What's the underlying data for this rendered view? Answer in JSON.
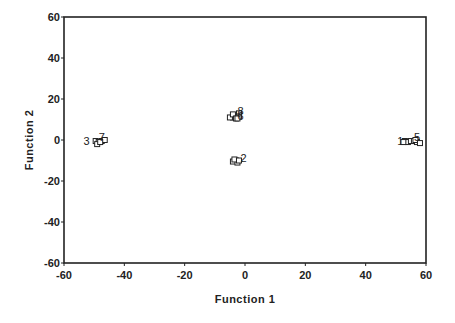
{
  "chart_data": {
    "type": "scatter",
    "title": "",
    "xlabel": "Function 1",
    "ylabel": "Function 2",
    "xlim": [
      -60,
      60
    ],
    "ylim": [
      -60,
      60
    ],
    "xticks": [
      -60,
      -40,
      -20,
      0,
      20,
      40,
      60
    ],
    "yticks": [
      -60,
      -40,
      -20,
      0,
      20,
      40,
      60
    ],
    "grid": false,
    "legend": "none",
    "marker": "open-square",
    "series": [
      {
        "name": "1",
        "label_pos": [
          51.5,
          -0.5
        ],
        "points": [
          [
            53,
            -0.5
          ],
          [
            54,
            -1
          ],
          [
            55,
            -0.5
          ],
          [
            52.5,
            -1
          ]
        ]
      },
      {
        "name": "5",
        "label_pos": [
          57,
          1.5
        ],
        "points": [
          [
            56,
            -0.5
          ],
          [
            57,
            -1
          ],
          [
            56.5,
            0
          ],
          [
            58,
            -1.5
          ]
        ]
      },
      {
        "name": "2",
        "label_pos": [
          -0.5,
          -9
        ],
        "points": [
          [
            -3,
            -10
          ],
          [
            -4,
            -10.5
          ],
          [
            -2.5,
            -11
          ],
          [
            -3.5,
            -9.5
          ],
          [
            -2,
            -10
          ]
        ]
      },
      {
        "name": "3",
        "label_pos": [
          -52.5,
          -0.5
        ],
        "points": [
          [
            -49.5,
            -0.5
          ],
          [
            -48.5,
            -1
          ],
          [
            -49,
            -2
          ]
        ]
      },
      {
        "name": "7",
        "label_pos": [
          -47.5,
          1.5
        ],
        "points": [
          [
            -47.5,
            -0.5
          ],
          [
            -46.5,
            0
          ],
          [
            -48,
            -1
          ]
        ]
      },
      {
        "name": "8",
        "label_pos": [
          -1.5,
          14
        ],
        "points": [
          [
            -2,
            13
          ],
          [
            -2,
            11.5
          ],
          [
            -3,
            11
          ]
        ]
      },
      {
        "name": "6",
        "label_pos": [
          -1.5,
          11.5
        ],
        "points": [
          [
            -4,
            11
          ],
          [
            -5,
            11
          ],
          [
            -4,
            12.5
          ],
          [
            -3,
            10.5
          ],
          [
            -2.5,
            10.5
          ]
        ]
      }
    ]
  },
  "axes": {
    "x_title": "Function 1",
    "y_title": "Function 2",
    "x_tick_labels": [
      "-60",
      "-40",
      "-20",
      "0",
      "20",
      "40",
      "60"
    ],
    "y_tick_labels": [
      "60",
      "40",
      "20",
      "0",
      "-20",
      "-40",
      "-60"
    ]
  }
}
